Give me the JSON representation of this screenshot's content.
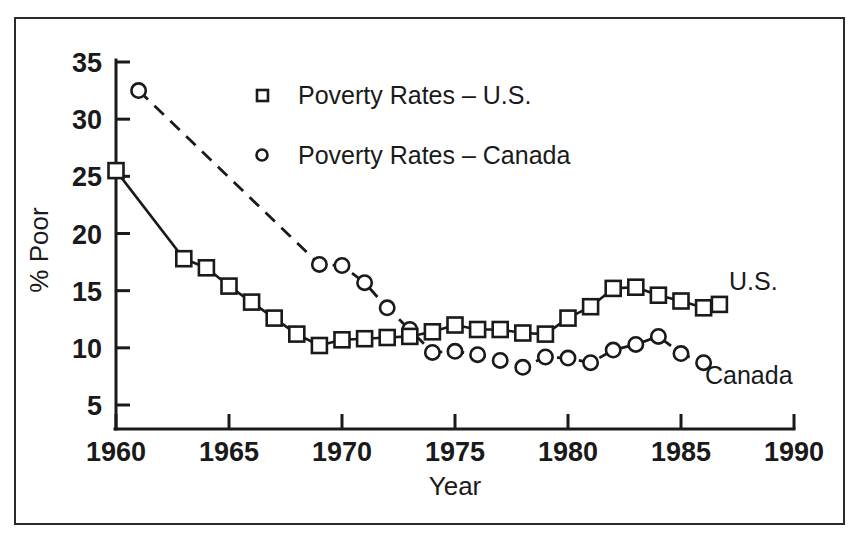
{
  "chart_data": {
    "type": "line",
    "title": "",
    "xlabel": "Year",
    "ylabel": "% Poor",
    "xlim": [
      1960,
      1990
    ],
    "ylim": [
      5,
      35
    ],
    "xticks": [
      1960,
      1965,
      1970,
      1975,
      1980,
      1985,
      1990
    ],
    "xtick_labels": [
      "1960",
      "1965",
      "1970",
      "1975",
      "1980",
      "1985",
      "1990"
    ],
    "yticks": [
      5,
      10,
      15,
      20,
      25,
      30,
      35
    ],
    "ytick_labels": [
      "5",
      "10",
      "15",
      "20",
      "25",
      "30",
      "35"
    ],
    "grid": false,
    "legend_position": "upper center",
    "series": [
      {
        "name": "Poverty Rates -  U.S.",
        "short_name": "U.S.",
        "marker": "square",
        "linestyle": "solid",
        "color": "#1a1a1a",
        "end_label": "U.S.",
        "x": [
          1960,
          1963,
          1964,
          1965,
          1966,
          1967,
          1968,
          1969,
          1970,
          1971,
          1972,
          1973,
          1974,
          1975,
          1976,
          1977,
          1978,
          1979,
          1980,
          1981,
          1982,
          1983,
          1984,
          1985,
          1986,
          1986.7
        ],
        "values": [
          25.5,
          17.8,
          17.0,
          15.4,
          14.0,
          12.6,
          11.2,
          10.2,
          10.7,
          10.8,
          10.9,
          11.0,
          11.4,
          12.0,
          11.6,
          11.6,
          11.3,
          11.2,
          12.6,
          13.6,
          15.2,
          15.3,
          14.6,
          14.1,
          13.5,
          13.8
        ]
      },
      {
        "name": "Poverty Rates -  Canada",
        "short_name": "Canada",
        "marker": "circle",
        "linestyle": "dashed",
        "color": "#1a1a1a",
        "end_label": "Canada",
        "x": [
          1961,
          1969,
          1970,
          1971,
          1972,
          1973,
          1974,
          1975,
          1976,
          1977,
          1978,
          1979,
          1980,
          1981,
          1982,
          1983,
          1984,
          1985,
          1986
        ],
        "values": [
          32.5,
          17.3,
          17.2,
          15.7,
          13.5,
          11.6,
          9.6,
          9.7,
          9.4,
          8.9,
          8.3,
          9.2,
          9.1,
          8.7,
          9.8,
          10.3,
          11.0,
          9.5,
          8.7
        ]
      }
    ],
    "annotations": [
      {
        "text": "U.S.",
        "x": 1988.2,
        "y": 15.1
      },
      {
        "text": "Canada",
        "x": 1988.0,
        "y": 6.8
      }
    ]
  },
  "legend": {
    "items": [
      {
        "marker": "square",
        "label": "Poverty Rates  –   U.S."
      },
      {
        "marker": "circle",
        "label": "Poverty Rates  –   Canada"
      }
    ]
  },
  "axes": {
    "x_title": "Year",
    "y_title": "% Poor"
  },
  "style": {
    "ink": "#1a1a1a",
    "frame": "#2b2b2b",
    "background": "#ffffff"
  }
}
